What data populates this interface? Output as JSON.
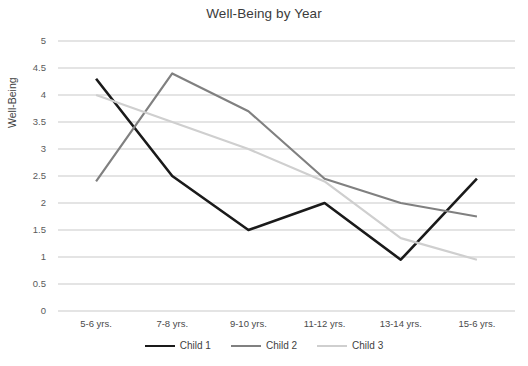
{
  "chart_data": {
    "type": "line",
    "title": "Well-Being by Year",
    "xlabel": "",
    "ylabel": "Well-Being",
    "categories": [
      "5-6 yrs.",
      "7-8 yrs.",
      "9-10 yrs.",
      "11-12 yrs.",
      "13-14 yrs.",
      "15-6 yrs."
    ],
    "ylim": [
      0,
      5
    ],
    "ytick_step": 0.5,
    "yticks": [
      "5",
      "4.5",
      "4",
      "3.5",
      "3",
      "2.5",
      "2",
      "1.5",
      "1",
      "0.5",
      "0"
    ],
    "grid": "horizontal",
    "legend_position": "bottom",
    "series": [
      {
        "name": "Child 1",
        "color": "#1a1a1a",
        "width": 2.6,
        "values": [
          4.3,
          2.5,
          1.5,
          2.0,
          0.95,
          2.45
        ]
      },
      {
        "name": "Child 2",
        "color": "#808080",
        "width": 2.2,
        "values": [
          2.4,
          4.4,
          3.7,
          2.45,
          2.0,
          1.75
        ]
      },
      {
        "name": "Child 3",
        "color": "#cfcfcf",
        "width": 2.2,
        "values": [
          4.0,
          3.5,
          3.0,
          2.4,
          1.35,
          0.95
        ]
      }
    ]
  },
  "colors": {
    "grid": "#c9c9c9",
    "background": "#ffffff",
    "text": "#404040"
  }
}
